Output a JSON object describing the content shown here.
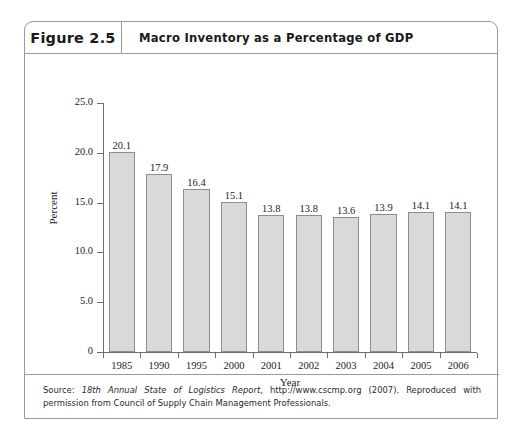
{
  "figure": {
    "number_label": "Figure 2.5",
    "title": "Macro Inventory as a Percentage of GDP"
  },
  "source": {
    "prefix": "Source: ",
    "italic_part": "18th Annual State of Logistics Report",
    "rest": ", http://www.cscmp.org (2007). Reproduced with permission from Council of Supply Chain Management Professionals."
  },
  "chart_data": {
    "type": "bar",
    "title": "Macro Inventory as a Percentage of GDP",
    "xlabel": "Year",
    "ylabel": "Percent",
    "categories": [
      "1985",
      "1990",
      "1995",
      "2000",
      "2001",
      "2002",
      "2003",
      "2004",
      "2005",
      "2006"
    ],
    "values": [
      20.1,
      17.9,
      16.4,
      15.1,
      13.8,
      13.8,
      13.6,
      13.9,
      14.1,
      14.1
    ],
    "value_labels": [
      "20.1",
      "17.9",
      "16.4",
      "15.1",
      "13.8",
      "13.8",
      "13.6",
      "13.9",
      "14.1",
      "14.1"
    ],
    "ylim": [
      0,
      25
    ],
    "ytick_values": [
      0,
      5,
      10,
      15,
      20,
      25
    ],
    "ytick_labels": [
      "0",
      "5.0",
      "10.0",
      "15.0",
      "20.0",
      "25.0"
    ],
    "grid": false,
    "legend": false,
    "bar_color": "#d9d9d9",
    "bar_edge_color": "#8d8d8d"
  }
}
